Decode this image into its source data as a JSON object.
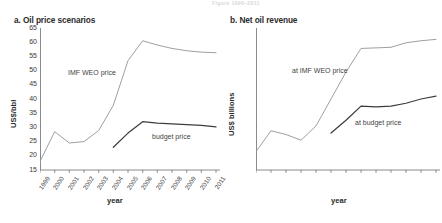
{
  "header": {
    "strip_text": "Figure  1999–2011"
  },
  "panels": [
    {
      "key": "a",
      "title": "a. Oil price scenarios",
      "ylabel": "US$/bbl",
      "xlabel": "year"
    },
    {
      "key": "b",
      "title": "b. Net oil revenue",
      "ylabel": "US$ billions",
      "xlabel": "year"
    }
  ],
  "series_labels": {
    "a_imf": "IMF WEO price",
    "a_budget": "budget price",
    "b_imf": "at IMF WEO price",
    "b_budget": "at budget price"
  },
  "chart_data": [
    {
      "type": "line",
      "title": "a. Oil price scenarios",
      "xlabel": "year",
      "ylabel": "US$/bbl",
      "ylim": [
        15,
        65
      ],
      "yticks": [
        15,
        20,
        25,
        30,
        35,
        40,
        45,
        50,
        55,
        60,
        65
      ],
      "categories": [
        1999,
        2000,
        2001,
        2002,
        2003,
        2004,
        2005,
        2006,
        2007,
        2008,
        2009,
        2010,
        2011
      ],
      "grid": false,
      "legend": "inline-annotations",
      "series": [
        {
          "name": "IMF WEO price",
          "color": "#9a9a9a",
          "values": [
            18.0,
            28.5,
            24.5,
            25.0,
            28.9,
            37.8,
            53.5,
            60.5,
            59.0,
            57.8,
            57.0,
            56.5,
            56.3
          ]
        },
        {
          "name": "budget price",
          "color": "#3d3d3d",
          "values": [
            null,
            null,
            null,
            null,
            null,
            23.0,
            28.0,
            32.0,
            31.5,
            31.2,
            31.0,
            30.7,
            30.2
          ]
        }
      ]
    },
    {
      "type": "line",
      "title": "b. Net oil revenue",
      "xlabel": "year",
      "ylabel": "US$ billions",
      "ylim": [
        0,
        50
      ],
      "yticks": [
        0,
        5,
        10,
        15,
        20,
        25,
        30,
        35,
        40,
        45,
        50
      ],
      "categories": [
        1999,
        2000,
        2001,
        2002,
        2003,
        2004,
        2005,
        2006,
        2007,
        2008,
        2009,
        2010,
        2011
      ],
      "grid": false,
      "legend": "inline-annotations",
      "series": [
        {
          "name": "at IMF WEO price",
          "color": "#9a9a9a",
          "values": [
            6.5,
            13.8,
            12.5,
            10.5,
            15.5,
            25.0,
            34.5,
            42.8,
            43.0,
            43.2,
            44.8,
            45.5,
            46.0
          ]
        },
        {
          "name": "at budget price",
          "color": "#3d3d3d",
          "values": [
            null,
            null,
            null,
            null,
            null,
            13.0,
            17.5,
            22.5,
            22.2,
            22.5,
            23.5,
            25.0,
            26.0
          ]
        }
      ]
    }
  ]
}
